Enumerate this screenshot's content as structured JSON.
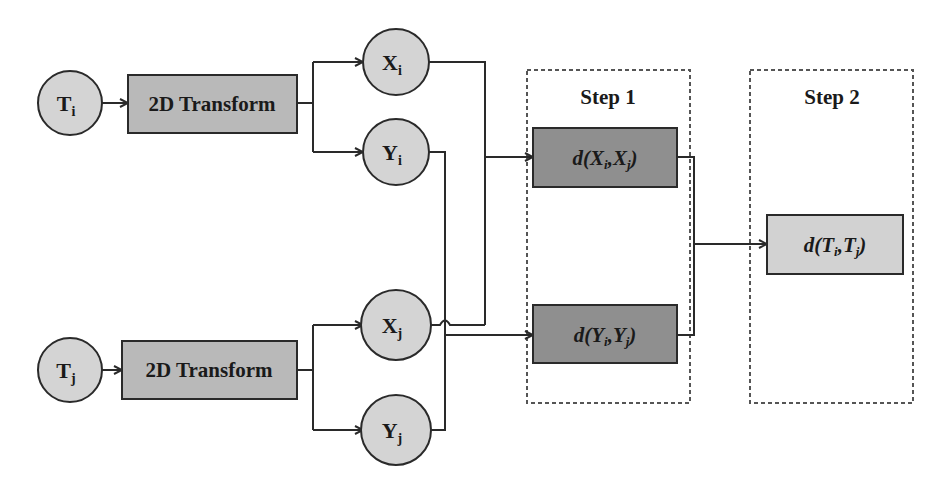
{
  "colors": {
    "background": "#ffffff",
    "circle_fill": "#d4d4d4",
    "transform_fill": "#b9b9b9",
    "step1_box_fill": "#8f8f8f",
    "step2_box_fill": "#d2d2d2",
    "stroke": "#2a2a2a",
    "dash": "#555555"
  },
  "inputs": [
    {
      "id": "Ti",
      "base": "T",
      "sub": "i"
    },
    {
      "id": "Tj",
      "base": "T",
      "sub": "j"
    }
  ],
  "transforms": [
    {
      "label": "2D Transform"
    },
    {
      "label": "2D Transform"
    }
  ],
  "components": [
    {
      "id": "Xi",
      "base": "X",
      "sub": "i"
    },
    {
      "id": "Yi",
      "base": "Y",
      "sub": "i"
    },
    {
      "id": "Xj",
      "base": "X",
      "sub": "j"
    },
    {
      "id": "Yj",
      "base": "Y",
      "sub": "j"
    }
  ],
  "steps": [
    {
      "title": "Step 1",
      "boxes": [
        {
          "fn": "d(",
          "a": "X",
          "a_sub": "i",
          "sep": ",",
          "b": "X",
          "b_sub": "j",
          "close": ")"
        },
        {
          "fn": "d(",
          "a": "Y",
          "a_sub": "i",
          "sep": ",",
          "b": "Y",
          "b_sub": "j",
          "close": ")"
        }
      ]
    },
    {
      "title": "Step 2",
      "boxes": [
        {
          "fn": "d(",
          "a": "T",
          "a_sub": "i",
          "sep": ",",
          "b": "T",
          "b_sub": "j",
          "close": ")"
        }
      ]
    }
  ]
}
